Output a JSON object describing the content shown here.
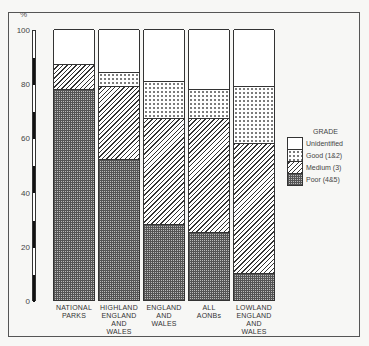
{
  "chart_data": {
    "type": "bar",
    "stacked": true,
    "title": "",
    "xlabel": "",
    "ylabel": "%",
    "ylim": [
      0,
      100
    ],
    "yticks": [
      0,
      20,
      40,
      60,
      80,
      100
    ],
    "categories": [
      "NATIONAL PARKS",
      "HIGHLAND ENGLAND AND WALES",
      "ENGLAND AND WALES",
      "ALL AONBs",
      "LOWLAND ENGLAND AND WALES"
    ],
    "category_lines": [
      [
        "NATIONAL",
        "PARKS"
      ],
      [
        "HIGHLAND",
        "ENGLAND",
        "AND",
        "WALES"
      ],
      [
        "ENGLAND",
        "AND",
        "WALES"
      ],
      [
        "ALL",
        "AONBs"
      ],
      [
        "LOWLAND",
        "ENGLAND",
        "AND",
        "WALES"
      ]
    ],
    "series": [
      {
        "name": "Poor (4&5)",
        "pattern": "cross-hatch",
        "values": [
          78,
          52,
          28,
          25,
          10
        ]
      },
      {
        "name": "Medium (3)",
        "pattern": "diagonal",
        "values": [
          9,
          27,
          39,
          42,
          48
        ]
      },
      {
        "name": "Good (1&2)",
        "pattern": "dots",
        "values": [
          0,
          5,
          14,
          11,
          21
        ]
      },
      {
        "name": "Unidentified",
        "pattern": "blank",
        "values": [
          13,
          16,
          19,
          22,
          21
        ]
      }
    ],
    "legend": {
      "title": "GRADE",
      "position": "right",
      "entries": [
        "Unidentified",
        "Good (1&2)",
        "Medium (3)",
        "Poor (4&5)"
      ]
    },
    "grid": false
  },
  "axis": {
    "unit": "%",
    "ticks": [
      "100",
      "80",
      "60",
      "40",
      "20",
      "0"
    ]
  },
  "labels": {
    "b0": [
      "NATIONAL",
      "PARKS"
    ],
    "b1": [
      "HIGHLAND",
      "ENGLAND",
      "AND",
      "WALES"
    ],
    "b2": [
      "ENGLAND",
      "AND",
      "WALES"
    ],
    "b3": [
      "ALL",
      "AONBs"
    ],
    "b4": [
      "LOWLAND",
      "ENGLAND",
      "AND",
      "WALES"
    ]
  },
  "legend": {
    "title": "GRADE",
    "unid": "Unidentified",
    "good": "Good (1&2)",
    "med": "Medium (3)",
    "poor": "Poor (4&5)"
  }
}
